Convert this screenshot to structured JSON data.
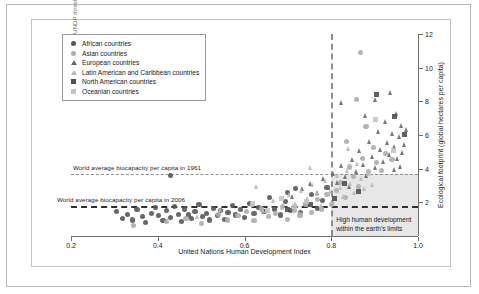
{
  "chart_data": {
    "type": "scatter",
    "title": "",
    "xlabel": "United Nations Human Development Index",
    "ylabel": "Ecological footprint (global hectares per capita)",
    "xlim": [
      0.2,
      1.0
    ],
    "ylim": [
      0,
      12
    ],
    "xticks": [
      "0.2",
      "0.4",
      "0.6",
      "0.8",
      "1.0"
    ],
    "xtick_values": [
      0.2,
      0.4,
      0.6,
      0.8,
      1.0
    ],
    "yticks": [
      "2",
      "4",
      "6",
      "8",
      "10",
      "12"
    ],
    "ytick_values": [
      2,
      4,
      6,
      8,
      10,
      12
    ],
    "grid": false,
    "legend_position": "top-left",
    "annotations": [
      {
        "id": "biocapacity-1961",
        "text": "World average biocapacity per capita in 1961",
        "type": "hline",
        "y": 3.7,
        "style": "dashed",
        "color": "#8e8e8e"
      },
      {
        "id": "biocapacity-2006",
        "text": "World average biocapacity per capita in 2006",
        "type": "hline",
        "y": 1.8,
        "style": "dashed",
        "color": "#2f2f2f"
      },
      {
        "id": "undp-threshold",
        "text": "UNDP threshold for high human development",
        "type": "vline",
        "x": 0.8,
        "style": "dashed",
        "color": "#8e8e8e"
      },
      {
        "id": "sustainable-region",
        "text_line1": "High human development",
        "text_line2": "within the earth's limits",
        "type": "rect",
        "x_range": [
          0.8,
          1.0
        ],
        "y_range": [
          0,
          3.7
        ],
        "color": "#e3e3e3"
      }
    ],
    "series": [
      {
        "name": "African countries",
        "marker": "circle",
        "color": "#575757",
        "points": [
          [
            0.305,
            1.45
          ],
          [
            0.318,
            1.05
          ],
          [
            0.33,
            1.3
          ],
          [
            0.342,
            0.95
          ],
          [
            0.352,
            1.55
          ],
          [
            0.364,
            1.15
          ],
          [
            0.372,
            0.8
          ],
          [
            0.385,
            1.35
          ],
          [
            0.394,
            1.7
          ],
          [
            0.402,
            1.2
          ],
          [
            0.412,
            0.9
          ],
          [
            0.421,
            1.5
          ],
          [
            0.43,
            1.1
          ],
          [
            0.438,
            1.75
          ],
          [
            0.447,
            1.3
          ],
          [
            0.455,
            0.85
          ],
          [
            0.462,
            1.6
          ],
          [
            0.47,
            1.25
          ],
          [
            0.478,
            1.05
          ],
          [
            0.486,
            1.45
          ],
          [
            0.495,
            1.85
          ],
          [
            0.503,
            1.15
          ],
          [
            0.512,
            1.35
          ],
          [
            0.52,
            0.95
          ],
          [
            0.528,
            1.65
          ],
          [
            0.537,
            1.2
          ],
          [
            0.545,
            1.5
          ],
          [
            0.553,
            1.0
          ],
          [
            0.562,
            1.4
          ],
          [
            0.572,
            1.8
          ],
          [
            0.58,
            1.25
          ],
          [
            0.59,
            1.55
          ],
          [
            0.6,
            1.1
          ],
          [
            0.612,
            1.95
          ],
          [
            0.622,
            1.35
          ],
          [
            0.632,
            1.7
          ],
          [
            0.645,
            1.45
          ],
          [
            0.658,
            2.3
          ],
          [
            0.67,
            1.6
          ],
          [
            0.683,
            1.25
          ],
          [
            0.695,
            2.05
          ],
          [
            0.706,
            1.5
          ],
          [
            0.718,
            2.8
          ],
          [
            0.73,
            1.4
          ],
          [
            0.742,
            1.85
          ],
          [
            0.755,
            2.45
          ],
          [
            0.768,
            1.65
          ],
          [
            0.78,
            2.1
          ],
          [
            0.43,
            3.6
          ],
          [
            0.7,
            2.6
          ],
          [
            0.79,
            2.9
          ]
        ]
      },
      {
        "name": "Asian countries",
        "marker": "circle",
        "color": "#adadad",
        "points": [
          [
            0.345,
            0.6
          ],
          [
            0.42,
            0.85
          ],
          [
            0.465,
            1.05
          ],
          [
            0.5,
            0.75
          ],
          [
            0.54,
            1.3
          ],
          [
            0.56,
            0.95
          ],
          [
            0.585,
            1.2
          ],
          [
            0.605,
            1.45
          ],
          [
            0.622,
            0.9
          ],
          [
            0.64,
            1.6
          ],
          [
            0.655,
            1.15
          ],
          [
            0.672,
            1.35
          ],
          [
            0.688,
            1.75
          ],
          [
            0.7,
            1.0
          ],
          [
            0.715,
            1.5
          ],
          [
            0.728,
            1.25
          ],
          [
            0.742,
            1.9
          ],
          [
            0.755,
            1.4
          ],
          [
            0.768,
            2.15
          ],
          [
            0.778,
            1.6
          ],
          [
            0.79,
            2.45
          ],
          [
            0.8,
            1.85
          ],
          [
            0.812,
            2.7
          ],
          [
            0.822,
            3.2
          ],
          [
            0.832,
            2.3
          ],
          [
            0.842,
            4.1
          ],
          [
            0.852,
            3.55
          ],
          [
            0.862,
            2.95
          ],
          [
            0.872,
            4.6
          ],
          [
            0.885,
            3.85
          ],
          [
            0.898,
            5.25
          ],
          [
            0.905,
            4.35
          ],
          [
            0.915,
            3.9
          ],
          [
            0.925,
            4.9
          ],
          [
            0.868,
            10.9
          ],
          [
            0.858,
            8.1
          ],
          [
            0.94,
            4.55
          ],
          [
            0.88,
            6.5
          ],
          [
            0.835,
            5.6
          ]
        ]
      },
      {
        "name": "European countries",
        "marker": "triangle",
        "color": "#6a6a6a",
        "points": [
          [
            0.712,
            2.35
          ],
          [
            0.735,
            2.8
          ],
          [
            0.752,
            3.1
          ],
          [
            0.768,
            2.55
          ],
          [
            0.782,
            3.4
          ],
          [
            0.795,
            2.9
          ],
          [
            0.806,
            3.7
          ],
          [
            0.815,
            3.15
          ],
          [
            0.824,
            4.2
          ],
          [
            0.833,
            3.55
          ],
          [
            0.842,
            2.95
          ],
          [
            0.85,
            4.55
          ],
          [
            0.858,
            3.85
          ],
          [
            0.866,
            5.1
          ],
          [
            0.874,
            4.25
          ],
          [
            0.882,
            3.6
          ],
          [
            0.889,
            5.6
          ],
          [
            0.896,
            4.7
          ],
          [
            0.903,
            4.05
          ],
          [
            0.909,
            6.2
          ],
          [
            0.915,
            5.15
          ],
          [
            0.92,
            4.45
          ],
          [
            0.926,
            6.8
          ],
          [
            0.931,
            5.55
          ],
          [
            0.936,
            4.85
          ],
          [
            0.941,
            6.1
          ],
          [
            0.946,
            5.3
          ],
          [
            0.95,
            7.3
          ],
          [
            0.954,
            4.6
          ],
          [
            0.958,
            5.9
          ],
          [
            0.962,
            6.55
          ],
          [
            0.966,
            4.95
          ],
          [
            0.97,
            5.45
          ],
          [
            0.974,
            6.3
          ],
          [
            0.825,
            7.9
          ],
          [
            0.902,
            8.1
          ],
          [
            0.938,
            8.5
          ],
          [
            0.88,
            7.15
          ],
          [
            0.96,
            4.15
          ],
          [
            0.946,
            3.95
          ]
        ]
      },
      {
        "name": "Latin American and Caribbean countries",
        "marker": "triangle",
        "color": "#b9b9b9",
        "points": [
          [
            0.492,
            1.15
          ],
          [
            0.545,
            1.55
          ],
          [
            0.588,
            1.3
          ],
          [
            0.618,
            1.85
          ],
          [
            0.645,
            1.5
          ],
          [
            0.668,
            2.1
          ],
          [
            0.688,
            1.7
          ],
          [
            0.705,
            2.45
          ],
          [
            0.718,
            1.95
          ],
          [
            0.732,
            2.7
          ],
          [
            0.745,
            2.2
          ],
          [
            0.758,
            3.05
          ],
          [
            0.768,
            2.5
          ],
          [
            0.778,
            1.8
          ],
          [
            0.788,
            3.3
          ],
          [
            0.798,
            2.65
          ],
          [
            0.806,
            2.05
          ],
          [
            0.815,
            3.6
          ],
          [
            0.822,
            2.85
          ],
          [
            0.83,
            2.35
          ],
          [
            0.838,
            3.9
          ],
          [
            0.846,
            3.1
          ],
          [
            0.854,
            2.6
          ],
          [
            0.862,
            4.3
          ],
          [
            0.87,
            3.4
          ],
          [
            0.878,
            2.8
          ],
          [
            0.886,
            3.7
          ],
          [
            0.895,
            3.05
          ],
          [
            0.628,
            2.95
          ],
          [
            0.752,
            4.05
          ],
          [
            0.84,
            5.2
          ]
        ]
      },
      {
        "name": "North American countries",
        "marker": "square",
        "color": "#4f4f4f",
        "points": [
          [
            0.905,
            8.4
          ],
          [
            0.945,
            7.1
          ],
          [
            0.752,
            1.85
          ],
          [
            0.7,
            1.6
          ],
          [
            0.808,
            2.2
          ],
          [
            0.862,
            2.65
          ],
          [
            0.83,
            3.1
          ],
          [
            0.968,
            6.05
          ]
        ]
      },
      {
        "name": "Oceanian countries",
        "marker": "square",
        "color": "#c4c4c4",
        "points": [
          [
            0.902,
            6.9
          ],
          [
            0.944,
            5.1
          ],
          [
            0.618,
            1.95
          ],
          [
            0.652,
            1.5
          ],
          [
            0.685,
            2.25
          ],
          [
            0.715,
            1.75
          ],
          [
            0.742,
            2.05
          ]
        ]
      }
    ]
  },
  "legend": {
    "items": [
      {
        "label": "African countries",
        "marker": "circle",
        "color": "#575757"
      },
      {
        "label": "Asian countries",
        "marker": "circle",
        "color": "#adadad"
      },
      {
        "label": "European countries",
        "marker": "triangle",
        "color": "#6a6a6a"
      },
      {
        "label": "Latin American and Caribbean countries",
        "marker": "triangle",
        "color": "#b9b9b9"
      },
      {
        "label": "North American countries",
        "marker": "square",
        "color": "#4f4f4f"
      },
      {
        "label": "Oceanian countries",
        "marker": "square",
        "color": "#c4c4c4"
      }
    ]
  }
}
